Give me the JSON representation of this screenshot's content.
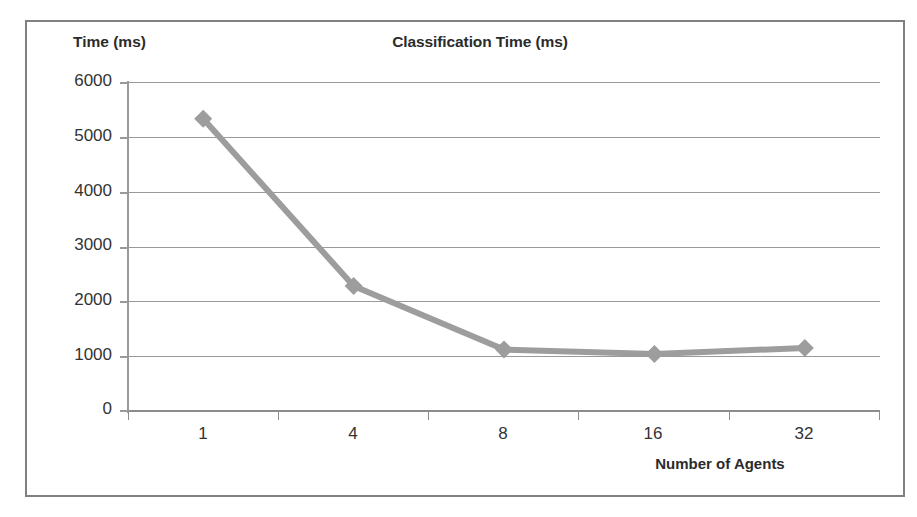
{
  "chart_data": {
    "type": "line",
    "title": "Classification Time (ms)",
    "xlabel": "Number of Agents",
    "ylabel": "Time (ms)",
    "categories": [
      "1",
      "4",
      "8",
      "16",
      "32"
    ],
    "series": [
      {
        "name": "Classification Time",
        "values": [
          5330,
          2280,
          1120,
          1040,
          1150
        ],
        "color": "#9d9d9d",
        "marker": "diamond"
      }
    ],
    "ylim": [
      0,
      6000
    ],
    "yticks": [
      6000,
      5000,
      4000,
      3000,
      2000,
      1000,
      0
    ],
    "ytick_labels": [
      "6000",
      "5000",
      "4000",
      "3000",
      "2000",
      "1000",
      "0"
    ],
    "grid": true,
    "grid_axis": "y",
    "legend": false,
    "legend_position": "none",
    "frame": true
  },
  "figure": {
    "background_color": "#ffffff",
    "frame_color": "#808080",
    "grid_color": "#9a9a9a",
    "text_color": "#2b2b2b",
    "tick_label_color": "#333333"
  }
}
